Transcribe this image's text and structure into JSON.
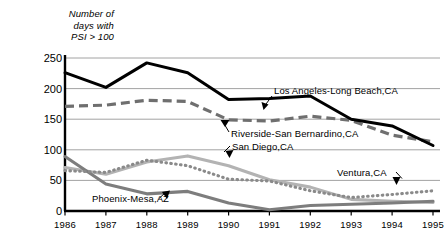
{
  "chart_data": {
    "type": "line",
    "title": "",
    "ylabel": "Number of\ndays with\nPSI > 100",
    "xlabel": "",
    "grid": true,
    "legend_position": "inline-annotations",
    "ylim": [
      0,
      250
    ],
    "yticks": [
      0,
      50,
      100,
      150,
      200,
      250
    ],
    "categories": [
      "1986",
      "1987",
      "1988",
      "1989",
      "1990",
      "1991",
      "1992",
      "1993",
      "1994",
      "1995"
    ],
    "x": [
      1986,
      1987,
      1988,
      1989,
      1990,
      1991,
      1992,
      1993,
      1994,
      1995
    ],
    "series": [
      {
        "name": "Los Angeles-Long Beach,CA",
        "style": "solid-thick-black",
        "color": "#000000",
        "values": [
          226,
          202,
          242,
          226,
          182,
          184,
          188,
          150,
          139,
          107
        ]
      },
      {
        "name": "Riverside-San Bernardino,CA",
        "style": "dashed-gray",
        "color": "#6f6f6f",
        "values": [
          171,
          173,
          181,
          179,
          149,
          147,
          155,
          148,
          124,
          113
        ]
      },
      {
        "name": "San Diego,CA",
        "style": "solid-light-gray",
        "color": "#b3b3b3",
        "values": [
          71,
          60,
          80,
          90,
          74,
          51,
          39,
          19,
          16,
          14
        ]
      },
      {
        "name": "Ventura,CA",
        "style": "dotted-gray",
        "color": "#8a8a8a",
        "values": [
          66,
          63,
          83,
          74,
          52,
          49,
          33,
          22,
          27,
          33
        ]
      },
      {
        "name": "Phoenix-Mesa,AZ",
        "style": "solid-medium-gray",
        "color": "#7d7d7d",
        "values": [
          89,
          44,
          28,
          32,
          13,
          2,
          9,
          11,
          13,
          16
        ]
      }
    ],
    "annotations": [
      {
        "label": "Los Angeles-Long Beach,CA",
        "target_series": "Los Angeles-Long Beach,CA"
      },
      {
        "label": "Riverside-San Bernardino,CA",
        "target_series": "Riverside-San Bernardino,CA"
      },
      {
        "label": "San Diego,CA",
        "target_series": "San Diego,CA"
      },
      {
        "label": "Ventura,CA",
        "target_series": "Ventura,CA"
      },
      {
        "label": "Phoenix-Mesa,AZ",
        "target_series": "Phoenix-Mesa,AZ"
      }
    ]
  }
}
